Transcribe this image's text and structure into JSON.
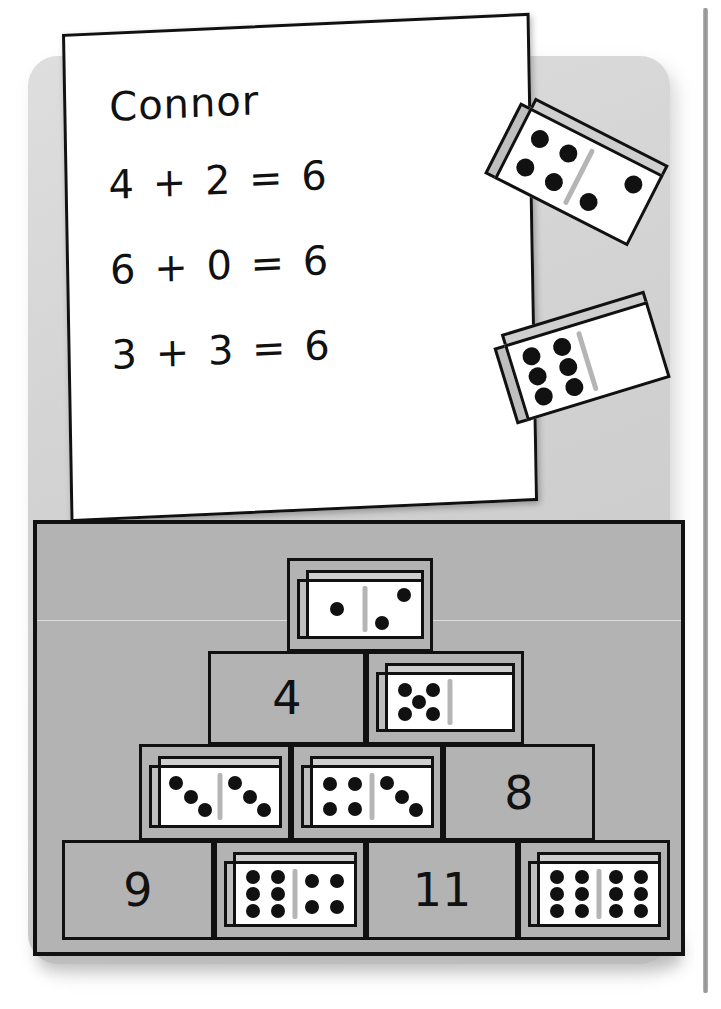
{
  "page": {
    "type": "math-worksheet-illustration",
    "colors": {
      "card_background": "#d2d2d2",
      "board_background": "#b3b3b3",
      "paper": "#ffffff",
      "ink": "#111111",
      "pip": "#111111",
      "domino_side": "#bfbfbf",
      "domino_cap": "#cfcfcf"
    }
  },
  "worksheet": {
    "name": "Connor",
    "equations": [
      {
        "left": "4",
        "op": "+",
        "right": "2",
        "eq": "=",
        "sum": "6",
        "text": "4 + 2 = 6"
      },
      {
        "left": "6",
        "op": "+",
        "right": "0",
        "eq": "=",
        "sum": "6",
        "text": "6 + 0 = 6"
      },
      {
        "left": "3",
        "op": "+",
        "right": "3",
        "eq": "=",
        "sum": "6",
        "text": "3 + 3 = 6"
      }
    ]
  },
  "loose_dominoes": [
    {
      "name": "domino-4-2",
      "left_pips": 4,
      "right_pips": 2,
      "total": 6,
      "rotation_deg": 27
    },
    {
      "name": "domino-6-0",
      "left_pips": 6,
      "right_pips": 0,
      "total": 6,
      "rotation_deg": -17
    }
  ],
  "pyramid": {
    "rows": [
      {
        "row_index": 0,
        "label": "top-row",
        "cells": [
          {
            "kind": "domino",
            "left_pips": 1,
            "right_pips": 2,
            "total": 3
          }
        ]
      },
      {
        "row_index": 1,
        "label": "second-row",
        "cells": [
          {
            "kind": "number",
            "value": "4"
          },
          {
            "kind": "domino",
            "left_pips": 5,
            "right_pips": 0,
            "total": 5
          }
        ]
      },
      {
        "row_index": 2,
        "label": "third-row",
        "cells": [
          {
            "kind": "domino",
            "left_pips": 3,
            "right_pips": 3,
            "total": 6
          },
          {
            "kind": "domino",
            "left_pips": 4,
            "right_pips": 3,
            "total": 7
          },
          {
            "kind": "number",
            "value": "8"
          }
        ]
      },
      {
        "row_index": 3,
        "label": "bottom-row",
        "cells": [
          {
            "kind": "number",
            "value": "9"
          },
          {
            "kind": "domino",
            "left_pips": 6,
            "right_pips": 4,
            "total": 10
          },
          {
            "kind": "number",
            "value": "11"
          },
          {
            "kind": "domino",
            "left_pips": 6,
            "right_pips": 6,
            "total": 12
          }
        ]
      }
    ]
  }
}
